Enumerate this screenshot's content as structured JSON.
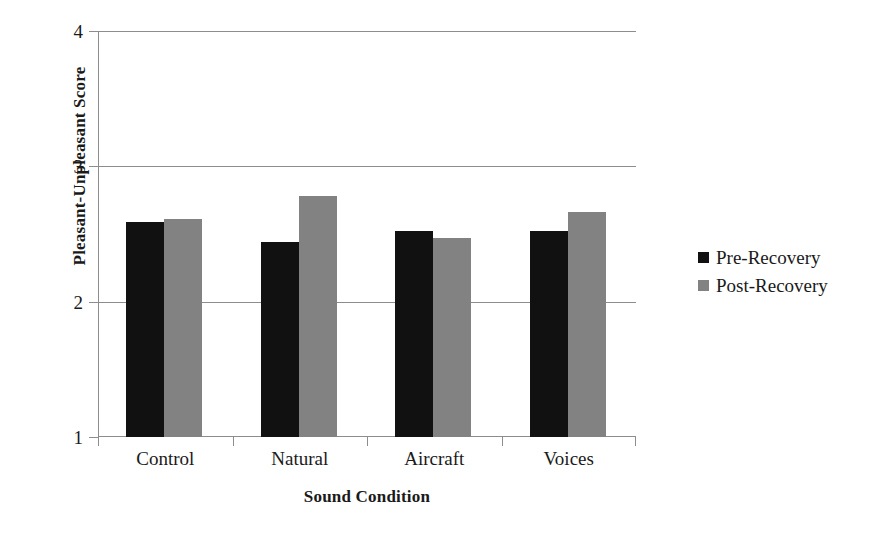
{
  "chart_data": {
    "type": "bar",
    "title": "",
    "subtitle": "",
    "xlabel": "Sound Condition",
    "ylabel": "Pleasant-Unpleasant Score",
    "categories": [
      "Control",
      "Natural",
      "Aircraft",
      "Voices"
    ],
    "series": [
      {
        "name": "Pre-Recovery",
        "color": "#111111",
        "values": [
          2.59,
          2.44,
          2.52,
          2.52
        ]
      },
      {
        "name": "Post-Recovery",
        "color": "#828282",
        "values": [
          2.61,
          2.78,
          2.47,
          2.66
        ]
      }
    ],
    "ylim": [
      1,
      4
    ],
    "yticks": [
      "1",
      "2",
      "3",
      "4"
    ],
    "ytick_values": [
      1,
      2,
      3,
      4
    ],
    "grid": "horizontal",
    "gridlines_at": [
      2,
      3,
      4
    ],
    "legend_position": "right",
    "axis_color": "#8d8d8d",
    "background_color": "#ffffff"
  }
}
